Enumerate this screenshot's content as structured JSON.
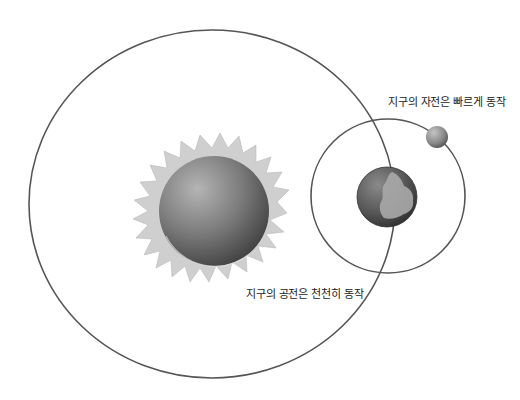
{
  "diagram": {
    "labels": {
      "rotation": "지구의 자전은 빠르게 동작",
      "revolution": "지구의 공전은 천천히 동작"
    },
    "objects": {
      "sun": "sun",
      "earth": "earth",
      "moon": "moon"
    },
    "orbits": {
      "earth_orbit": "earth-orbit-around-sun",
      "moon_orbit": "moon-orbit-around-earth"
    },
    "colors": {
      "background": "#ffffff",
      "orbit_line": "#555555",
      "sun_rays": "#c8c8c8",
      "sun_body": "#7a7a7a",
      "earth_ocean": "#5a5a5a",
      "earth_land": "#a8a8a8",
      "moon": "#8c8c8c"
    }
  }
}
